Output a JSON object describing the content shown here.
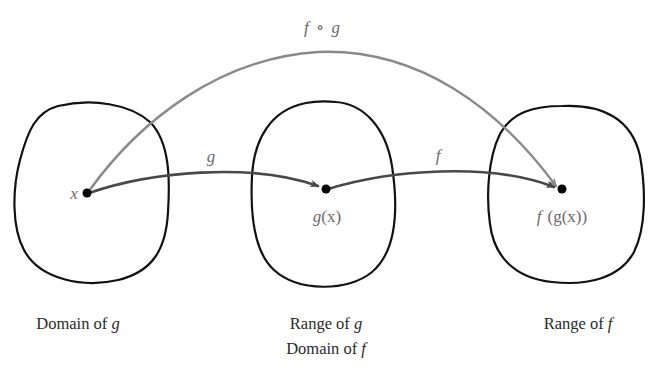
{
  "diagram": {
    "colors": {
      "set_outline": "#111111",
      "arrow_g_f": "#484848",
      "arrow_composite": "#8a8a8a",
      "math_label": "#6a6a6a",
      "caption": "#2a2a2a"
    },
    "sets": [
      {
        "id": "domain-g",
        "caption_lines": [
          {
            "text": "Domain of ",
            "var": "g"
          }
        ]
      },
      {
        "id": "range-g-domain-f",
        "caption_lines": [
          {
            "text": "Range of ",
            "var": "g"
          },
          {
            "text": "Domain of ",
            "var": "f"
          }
        ]
      },
      {
        "id": "range-f",
        "caption_lines": [
          {
            "text": "Range of ",
            "var": "f"
          }
        ]
      }
    ],
    "points": [
      {
        "id": "x",
        "label": "x"
      },
      {
        "id": "gx",
        "label_fn": "g",
        "label_arg": "(x)"
      },
      {
        "id": "fgx",
        "label_fn": "f",
        "label_rest": "(g(x))"
      }
    ],
    "arrows": [
      {
        "id": "g",
        "label": "g",
        "from": "x",
        "to": "gx"
      },
      {
        "id": "f",
        "label": "f",
        "from": "gx",
        "to": "fgx"
      },
      {
        "id": "composite",
        "label_f": "f",
        "label_op": "∘",
        "label_g": "g",
        "from": "x",
        "to": "fgx"
      }
    ]
  }
}
